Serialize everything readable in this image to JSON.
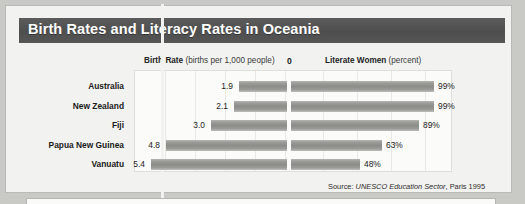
{
  "banner": {
    "title": "Birth Rates and Literacy Rates in Oceania"
  },
  "header": {
    "birth_rate_bold": "Birth Rate",
    "birth_rate_sub": "(births per 1,000 people)",
    "zero_marker": "0",
    "literate_bold": "Literate Women",
    "literate_sub": "(percent)"
  },
  "source": {
    "prefix": "Source:",
    "italic": "UNESCO Education Sector",
    "suffix": ", Paris 1995"
  },
  "colors": {
    "banner": "#545454",
    "bar": "#8c8c88",
    "card": "#f2f2f0",
    "plot": "#fbfbfa",
    "gridline": "#e8e8e4",
    "text": "#1a1a1a"
  },
  "chart_data": {
    "type": "bar",
    "title": "Birth Rates and Literacy Rates in Oceania",
    "subtype": "diverging-bidirectional-bar",
    "categories": [
      "Australia",
      "New Zealand",
      "Fiji",
      "Papua New Guinea",
      "Vanuatu"
    ],
    "series": [
      {
        "name": "Birth Rate",
        "unit": "births per 1,000 people",
        "direction": "left",
        "values": [
          1.9,
          2.1,
          3.0,
          4.8,
          5.4
        ],
        "labels": [
          "1.9",
          "2.1",
          "3.0",
          "4.8",
          "5.4"
        ],
        "max": 6.0
      },
      {
        "name": "Literate Women",
        "unit": "percent",
        "direction": "right",
        "values": [
          99,
          99,
          89,
          63,
          48
        ],
        "labels": [
          "99%",
          "99%",
          "89%",
          "63%",
          "48%"
        ],
        "max": 100
      }
    ],
    "xlabel": "",
    "ylabel": "",
    "grid": true,
    "legend": "none",
    "axis_zero_label": "0"
  }
}
